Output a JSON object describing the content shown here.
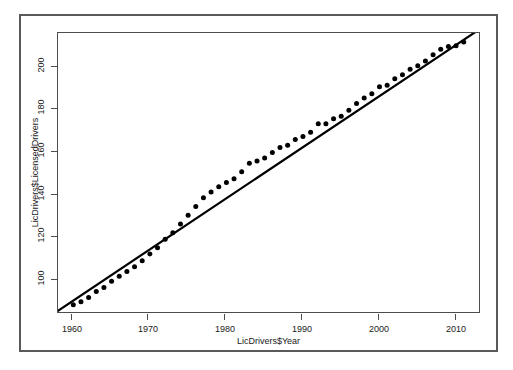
{
  "figure": {
    "background_color": "#ffffff",
    "frame_color": "#595959",
    "axis_color": "#4d4d4d",
    "point_color": "#000000",
    "line_color": "#000000"
  },
  "chart_data": {
    "type": "scatter",
    "title": "",
    "subtitle": "",
    "xlabel": "LicDrivers$Year",
    "ylabel": "LicDrivers$LicensedDrivers",
    "xlim": [
      1958.0,
      2013.0
    ],
    "ylim": [
      84.0,
      216.0
    ],
    "xticks": [
      1960,
      1970,
      1980,
      1990,
      2000,
      2010
    ],
    "xtick_labels": [
      "1960",
      "1970",
      "1980",
      "1990",
      "2000",
      "2010"
    ],
    "yticks": [
      100,
      120,
      140,
      160,
      180,
      200
    ],
    "ytick_labels": [
      "100",
      "120",
      "140",
      "160",
      "180",
      "200"
    ],
    "grid": false,
    "legend": null,
    "legend_position": "none",
    "series": [
      {
        "name": "LicensedDrivers",
        "kind": "scatter",
        "marker": "filled-circle",
        "marker_size_px": 5,
        "color": "#000000",
        "x": [
          1960,
          1961,
          1962,
          1963,
          1964,
          1965,
          1966,
          1967,
          1968,
          1969,
          1970,
          1971,
          1972,
          1973,
          1974,
          1975,
          1976,
          1977,
          1978,
          1979,
          1980,
          1981,
          1982,
          1983,
          1984,
          1985,
          1986,
          1987,
          1988,
          1989,
          1990,
          1991,
          1992,
          1993,
          1994,
          1995,
          1996,
          1997,
          1998,
          1999,
          2000,
          2001,
          2002,
          2003,
          2004,
          2005,
          2006,
          2007,
          2008,
          2009,
          2010,
          2011
        ],
        "y": [
          87.4,
          88.9,
          90.9,
          93.7,
          95.6,
          98.5,
          100.9,
          103.2,
          105.4,
          108.3,
          111.5,
          114.4,
          118.4,
          121.5,
          125.6,
          129.8,
          133.9,
          138.1,
          140.8,
          143.3,
          145.3,
          147.1,
          150.3,
          154.4,
          155.4,
          156.9,
          159.5,
          161.8,
          162.9,
          165.6,
          167.0,
          169.0,
          173.1,
          173.1,
          175.4,
          176.6,
          179.5,
          182.7,
          185.2,
          187.2,
          190.6,
          191.3,
          194.3,
          196.2,
          198.9,
          200.5,
          202.8,
          205.7,
          208.3,
          209.6,
          210.0,
          211.8
        ]
      },
      {
        "name": "Linear fit (lm)",
        "kind": "line",
        "color": "#000000",
        "line_width_px": 2.2,
        "endpoints_x": [
          1958.0,
          2013.0
        ],
        "endpoints_y": [
          84.6,
          217.6
        ],
        "slope": 2.418,
        "intercept_at_1960": 89.5
      }
    ],
    "units_note": "Licensed drivers in millions"
  }
}
